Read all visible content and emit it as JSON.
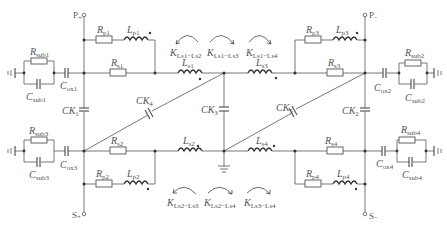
{
  "figure": {
    "type": "circuit-schematic",
    "terminals": {
      "p_plus": {
        "main": "P",
        "sub": "+"
      },
      "p_minus": {
        "main": "P",
        "sub": "−"
      },
      "s_plus": {
        "main": "S",
        "sub": "+"
      },
      "s_minus": {
        "main": "S",
        "sub": "−"
      }
    },
    "components": {
      "Rp1": {
        "main": "R",
        "sub": "p1"
      },
      "Lp1": {
        "main": "L",
        "sub": "p1"
      },
      "Rp2": {
        "main": "R",
        "sub": "p2"
      },
      "Lp2": {
        "main": "L",
        "sub": "p2"
      },
      "Rp3": {
        "main": "R",
        "sub": "p3"
      },
      "Lp3": {
        "main": "L",
        "sub": "p3"
      },
      "Rp4": {
        "main": "R",
        "sub": "p4"
      },
      "Lp4": {
        "main": "L",
        "sub": "p4"
      },
      "Rs1": {
        "main": "R",
        "sub": "s1"
      },
      "Ls1": {
        "main": "L",
        "sub": "s1"
      },
      "Rs2": {
        "main": "R",
        "sub": "s2"
      },
      "Ls2": {
        "main": "L",
        "sub": "s2"
      },
      "Rs3": {
        "main": "R",
        "sub": "s3"
      },
      "Ls3": {
        "main": "L",
        "sub": "s3"
      },
      "Rs4": {
        "main": "R",
        "sub": "s4"
      },
      "Ls4": {
        "main": "L",
        "sub": "s4"
      },
      "Rsub1": {
        "main": "R",
        "sub": "sub1"
      },
      "Csub1": {
        "main": "C",
        "sub": "sub1"
      },
      "Rsub2": {
        "main": "R",
        "sub": "sub2"
      },
      "Csub2": {
        "main": "C",
        "sub": "sub2"
      },
      "Rsub3": {
        "main": "R",
        "sub": "sub3"
      },
      "Csub3": {
        "main": "C",
        "sub": "sub3"
      },
      "Rsub4": {
        "main": "R",
        "sub": "sub4"
      },
      "Csub4": {
        "main": "C",
        "sub": "sub4"
      },
      "Cox1": {
        "main": "C",
        "sub": "ox1"
      },
      "Cox2": {
        "main": "C",
        "sub": "ox2"
      },
      "Cox3": {
        "main": "C",
        "sub": "ox3"
      },
      "Cox4": {
        "main": "C",
        "sub": "ox4"
      },
      "CK1": {
        "main": "CK",
        "sub": "1"
      },
      "CK2": {
        "main": "CK",
        "sub": "2"
      },
      "CK3": {
        "main": "CK",
        "sub": "3"
      },
      "CK4": {
        "main": "CK",
        "sub": "4"
      },
      "CK5": {
        "main": "CK",
        "sub": "5"
      }
    },
    "couplings": {
      "top": [
        {
          "main": "K",
          "sub": "Ls1−Ls2"
        },
        {
          "main": "K",
          "sub": "Ls1−Ls3"
        },
        {
          "main": "K",
          "sub": "Ls1−Ls4"
        }
      ],
      "bottom": [
        {
          "main": "K",
          "sub": "Ls2−Ls3"
        },
        {
          "main": "K",
          "sub": "Ls2−Ls4"
        },
        {
          "main": "K",
          "sub": "Ls3−Ls4"
        }
      ]
    },
    "colors": {
      "line": "#6a6a6a",
      "text": "#555555",
      "background": "#ffffff"
    }
  }
}
